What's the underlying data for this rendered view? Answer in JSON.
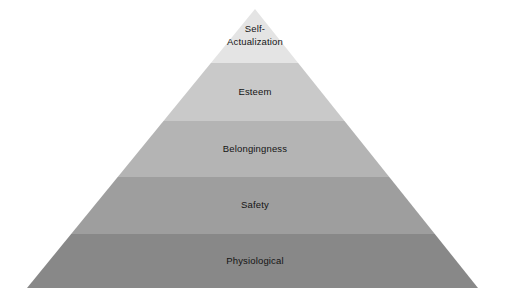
{
  "diagram": {
    "type": "pyramid",
    "name": "hierarchy-of-needs-pyramid",
    "background_color": "#ffffff",
    "label_color": "#141414",
    "geometry": {
      "apex_x": 255,
      "apex_y": 9,
      "base_left_x": 27,
      "base_right_x": 478,
      "base_y": 288
    },
    "tiers": [
      {
        "label": "Self-",
        "label_line2": "Actualization",
        "lines": [
          "Self-",
          "Actualization"
        ],
        "level": 1,
        "position": "top",
        "color": "#e4e4e4",
        "top_y": 9,
        "bottom_y": 63,
        "label_y": 36
      },
      {
        "label": "Esteem",
        "lines": [
          "Esteem"
        ],
        "level": 2,
        "position": "second",
        "color": "#c9c9c9",
        "top_y": 63,
        "bottom_y": 121,
        "label_y": 92
      },
      {
        "label": "Belongingness",
        "lines": [
          "Belongingness"
        ],
        "level": 3,
        "position": "middle",
        "color": "#b4b4b4",
        "top_y": 121,
        "bottom_y": 177,
        "label_y": 149
      },
      {
        "label": "Safety",
        "lines": [
          "Safety"
        ],
        "level": 4,
        "position": "fourth",
        "color": "#9e9e9e",
        "top_y": 177,
        "bottom_y": 234,
        "label_y": 205
      },
      {
        "label": "Physiological",
        "lines": [
          "Physiological"
        ],
        "level": 5,
        "position": "base",
        "color": "#888888",
        "top_y": 234,
        "bottom_y": 288,
        "label_y": 261
      }
    ]
  }
}
